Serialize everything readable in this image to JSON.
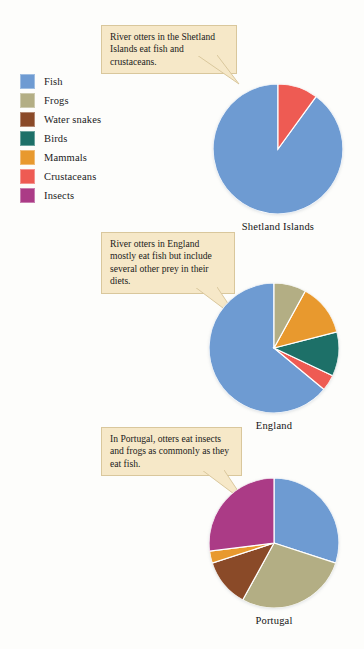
{
  "legend": {
    "items": [
      {
        "label": "Fish",
        "color": "#6e9bd2"
      },
      {
        "label": "Frogs",
        "color": "#b3ae84"
      },
      {
        "label": "Water snakes",
        "color": "#8a4a28"
      },
      {
        "label": "Birds",
        "color": "#1d7068"
      },
      {
        "label": "Mammals",
        "color": "#e8992e"
      },
      {
        "label": "Crustaceans",
        "color": "#ee5b53"
      },
      {
        "label": "Insects",
        "color": "#ab3b86"
      }
    ]
  },
  "callouts": {
    "shetland": "River otters in the Shetland Islands eat fish and crustaceans.",
    "england": "River otters in England mostly eat fish but include several other prey in their diets.",
    "portugal": "In Portugal, otters eat insects and frogs as commonly as they eat fish."
  },
  "captions": {
    "shetland": "Shetland Islands",
    "england": "England",
    "portugal": "Portugal"
  },
  "chart_data": [
    {
      "type": "pie",
      "title": "Shetland Islands",
      "categories": [
        "Fish",
        "Crustaceans"
      ],
      "values": [
        90,
        10
      ],
      "colors": [
        "#6e9bd2",
        "#ee5b53"
      ],
      "unit": "percent of diet",
      "start_angle": 0,
      "direction": "counterclockwise",
      "legend_position": "left"
    },
    {
      "type": "pie",
      "title": "England",
      "categories": [
        "Fish",
        "Crustaceans",
        "Birds",
        "Mammals",
        "Frogs"
      ],
      "values": [
        64,
        4,
        11,
        13,
        8
      ],
      "colors": [
        "#6e9bd2",
        "#ee5b53",
        "#1d7068",
        "#e8992e",
        "#b3ae84"
      ],
      "unit": "percent of diet",
      "start_angle": 0,
      "direction": "counterclockwise",
      "legend_position": "left"
    },
    {
      "type": "pie",
      "title": "Portugal",
      "categories": [
        "Fish",
        "Frogs",
        "Water snakes",
        "Mammals",
        "Insects"
      ],
      "values": [
        30,
        28,
        12,
        3,
        27
      ],
      "colors": [
        "#6e9bd2",
        "#b3ae84",
        "#8a4a28",
        "#e8992e",
        "#ab3b86"
      ],
      "unit": "percent of diet",
      "start_angle": 0,
      "direction": "clockwise",
      "legend_position": "left"
    }
  ]
}
